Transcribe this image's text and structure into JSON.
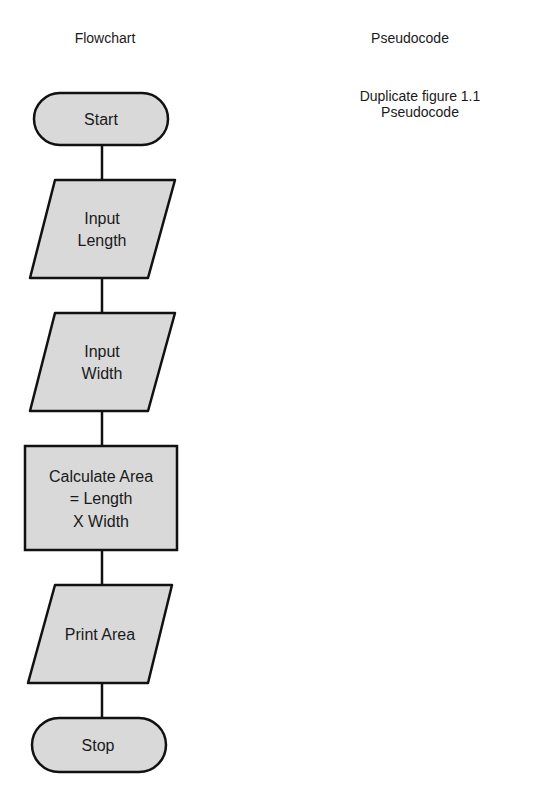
{
  "headings": {
    "flowchart": "Flowchart",
    "pseudocode": "Pseudocode"
  },
  "pseudocode_note": {
    "line1": "Duplicate figure 1.1",
    "line2": "Pseudocode"
  },
  "colors": {
    "shape_fill": "#d9d9d9",
    "stroke": "#111111",
    "background": "#ffffff"
  },
  "flowchart": {
    "nodes": [
      {
        "id": "start",
        "type": "terminator",
        "lines": [
          "Start"
        ]
      },
      {
        "id": "input-length",
        "type": "input-output",
        "lines": [
          "Input",
          "Length"
        ]
      },
      {
        "id": "input-width",
        "type": "input-output",
        "lines": [
          "Input",
          "Width"
        ]
      },
      {
        "id": "calculate-area",
        "type": "process",
        "lines": [
          "Calculate Area",
          "= Length",
          "X Width"
        ]
      },
      {
        "id": "print-area",
        "type": "input-output",
        "lines": [
          "Print Area"
        ]
      },
      {
        "id": "stop",
        "type": "terminator",
        "lines": [
          "Stop"
        ]
      }
    ],
    "edges": [
      [
        "start",
        "input-length"
      ],
      [
        "input-length",
        "input-width"
      ],
      [
        "input-width",
        "calculate-area"
      ],
      [
        "calculate-area",
        "print-area"
      ],
      [
        "print-area",
        "stop"
      ]
    ]
  }
}
